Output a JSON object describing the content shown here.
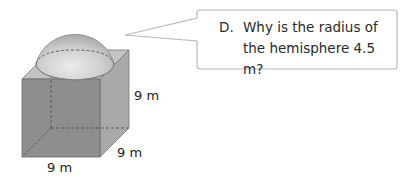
{
  "figure": {
    "shape": "cube with hemisphere on top",
    "dimensions": {
      "height_label": "9 m",
      "depth_label": "9 m",
      "width_label": "9 m"
    },
    "colors": {
      "front_face": "#8c8c8c",
      "side_face": "#a8a8a8",
      "top_face": "#c4c4c4",
      "hemisphere": "#cfcfcf",
      "hidden_edges": "#555555"
    }
  },
  "callout": {
    "letter": "D.",
    "line1": "Why is the radius of",
    "line2": "the hemisphere 4.5 m?"
  }
}
